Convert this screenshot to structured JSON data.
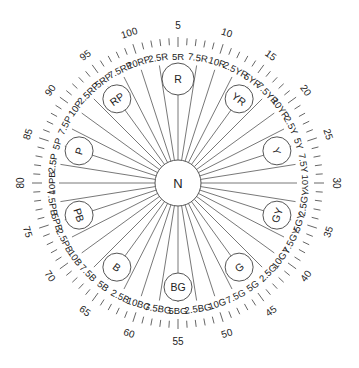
{
  "center": {
    "label": "N",
    "cx": 178,
    "cy": 183,
    "r": 23
  },
  "colors": {
    "line": "#555555",
    "text": "#222222",
    "background": "#ffffff"
  },
  "geometry": {
    "tick_inner": 138,
    "tick_outer": 145,
    "number_radius": 158,
    "label_radius": 127,
    "line_outer": 119,
    "hue_circle_radius": 104
  },
  "major_hues": [
    {
      "code": "R",
      "value": 5
    },
    {
      "code": "YR",
      "value": 15
    },
    {
      "code": "Y",
      "value": 25
    },
    {
      "code": "GY",
      "value": 35
    },
    {
      "code": "G",
      "value": 45
    },
    {
      "code": "BG",
      "value": 55
    },
    {
      "code": "B",
      "value": 65
    },
    {
      "code": "PB",
      "value": 75
    },
    {
      "code": "P",
      "value": 85
    },
    {
      "code": "RP",
      "value": 95
    }
  ],
  "hue_labels": [
    {
      "text": "2.5R",
      "value": 2.5
    },
    {
      "text": "5R",
      "value": 5
    },
    {
      "text": "7.5R",
      "value": 7.5
    },
    {
      "text": "10R",
      "value": 10
    },
    {
      "text": "2.5YR",
      "value": 12.5
    },
    {
      "text": "5YR",
      "value": 15
    },
    {
      "text": "7.5YR",
      "value": 17.5
    },
    {
      "text": "10YR",
      "value": 20
    },
    {
      "text": "2.5Y",
      "value": 22.5
    },
    {
      "text": "5Y",
      "value": 25
    },
    {
      "text": "7.5Y",
      "value": 27.5
    },
    {
      "text": "10Y",
      "value": 30
    },
    {
      "text": "2.5GY",
      "value": 32.5
    },
    {
      "text": "5GY",
      "value": 35
    },
    {
      "text": "7.5GY",
      "value": 37.5
    },
    {
      "text": "10GY",
      "value": 40
    },
    {
      "text": "2.5G",
      "value": 42.5
    },
    {
      "text": "5G",
      "value": 45
    },
    {
      "text": "7.5G",
      "value": 47.5
    },
    {
      "text": "10G",
      "value": 50
    },
    {
      "text": "2.5BG",
      "value": 52.5
    },
    {
      "text": "5BG",
      "value": 55
    },
    {
      "text": "7.5BG",
      "value": 57.5
    },
    {
      "text": "10BG",
      "value": 60
    },
    {
      "text": "2.5B",
      "value": 62.5
    },
    {
      "text": "5B",
      "value": 65
    },
    {
      "text": "7.5B",
      "value": 67.5
    },
    {
      "text": "10B",
      "value": 70
    },
    {
      "text": "2.5PB",
      "value": 72.5
    },
    {
      "text": "5PB",
      "value": 75
    },
    {
      "text": "7.5PB",
      "value": 77.5
    },
    {
      "text": "10PB",
      "value": 80
    },
    {
      "text": "2.5P",
      "value": 82.5
    },
    {
      "text": "5P",
      "value": 85
    },
    {
      "text": "7.5P",
      "value": 87.5
    },
    {
      "text": "10P",
      "value": 90
    },
    {
      "text": "2.5RP",
      "value": 92.5
    },
    {
      "text": "5RP",
      "value": 95
    },
    {
      "text": "7.5RP",
      "value": 97.5
    },
    {
      "text": "10RP",
      "value": 100
    }
  ],
  "scale_numbers": [
    5,
    10,
    15,
    20,
    25,
    30,
    35,
    40,
    45,
    50,
    55,
    60,
    65,
    70,
    75,
    80,
    85,
    90,
    95,
    100
  ],
  "tick_count": 100
}
